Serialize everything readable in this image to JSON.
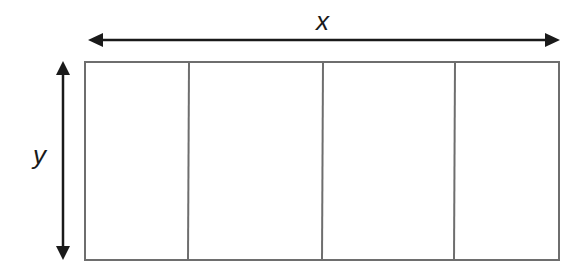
{
  "diagram": {
    "type": "rectangle-partition",
    "labels": {
      "width": "x",
      "height": "y"
    },
    "sections": 4,
    "colors": {
      "arrow": "#1a1a1a",
      "border": "#6e6e6e",
      "background": "#ffffff"
    }
  }
}
